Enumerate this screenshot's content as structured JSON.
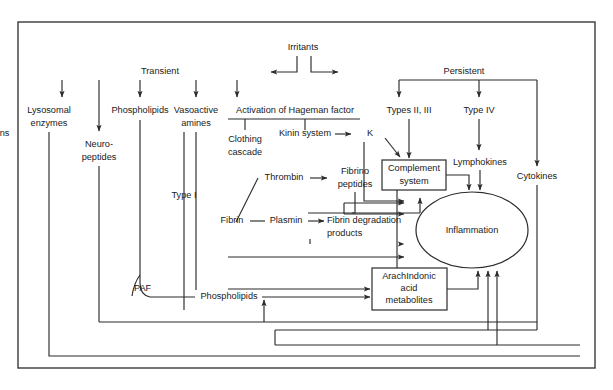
{
  "figure": {
    "type": "flow-diagram",
    "background_color": "#ffffff",
    "line_color": "#2b2b2b",
    "frame_color": "#3a3a3a"
  },
  "nodes": {
    "irritants": "Irritants",
    "transient": "Transient",
    "persistent": "Persistent",
    "lysosomal_enzymes_l1": "Lysosomal",
    "lysosomal_enzymes_l2": "enzymes",
    "neuropeptides_l1": "Neuro-",
    "neuropeptides_l2": "peptides",
    "phospholipids_top": "Phospholipids",
    "vasoactive_amines_l1": "Vasoactive",
    "vasoactive_amines_l2": "amines",
    "hageman": "Activation of Hageman factor",
    "kinin_system": "Kinin system",
    "kinins": "Kinins",
    "clothing_cascade_l1": "Clothing",
    "clothing_cascade_l2": "cascade",
    "thrombin": "Thrombin",
    "fibrino_peptides_l1": "Fibrino",
    "fibrino_peptides_l2": "peptides",
    "fibrin": "Fibrin",
    "plasmin": "Plasmin",
    "fibrin_degradation_l1": "Fibrin degradation",
    "fibrin_degradation_l2": "products",
    "types_ii_iii": "Types II, III",
    "type_iv": "Type IV",
    "type_i": "Type I",
    "paf": "PAF",
    "phospholipids_bottom": "Phospholipids",
    "complement_system_l1": "Complement",
    "complement_system_l2": "system",
    "lymphokines": "Lymphokines",
    "cytokines": "Cytokines",
    "arachidonic_l1": "ArachIndonic",
    "arachidonic_l2": "acid",
    "arachidonic_l3": "metabolites",
    "inflammation": "Inflammation"
  }
}
